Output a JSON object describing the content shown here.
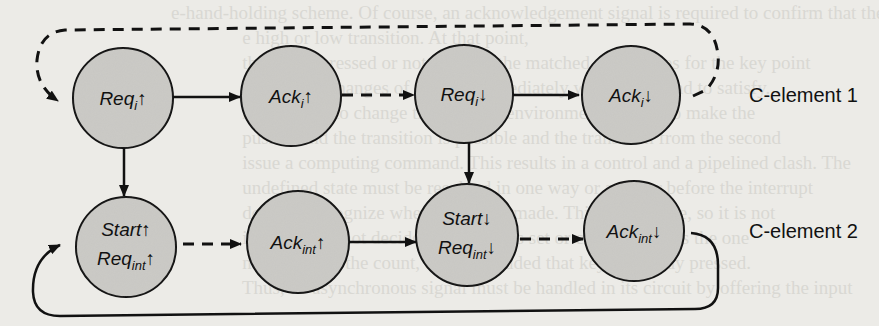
{
  "diagram": {
    "colors": {
      "node_fill": "#c8c7c3",
      "stroke": "#111111",
      "background": "#ecebe7"
    },
    "groups": [
      {
        "id": "c1",
        "label": "C-element 1"
      },
      {
        "id": "c2",
        "label": "C-element 2"
      }
    ],
    "nodes": [
      {
        "id": "req_i_up",
        "group": "c1",
        "lines": [
          {
            "base": "Req",
            "sub": "i",
            "arrow": "↑"
          }
        ]
      },
      {
        "id": "ack_i_up",
        "group": "c1",
        "lines": [
          {
            "base": "Ack",
            "sub": "i",
            "arrow": "↑"
          }
        ]
      },
      {
        "id": "req_i_down",
        "group": "c1",
        "lines": [
          {
            "base": "Req",
            "sub": "i",
            "arrow": "↓"
          }
        ]
      },
      {
        "id": "ack_i_down",
        "group": "c1",
        "lines": [
          {
            "base": "Ack",
            "sub": "i",
            "arrow": "↓"
          }
        ]
      },
      {
        "id": "start_up",
        "group": "c2",
        "lines": [
          {
            "base": "Start",
            "sub": "",
            "arrow": "↑"
          },
          {
            "base": "Req",
            "sub": "int",
            "arrow": "↑"
          }
        ]
      },
      {
        "id": "ack_int_up",
        "group": "c2",
        "lines": [
          {
            "base": "Ack",
            "sub": "int",
            "arrow": "↑"
          }
        ]
      },
      {
        "id": "start_down",
        "group": "c2",
        "lines": [
          {
            "base": "Start",
            "sub": "",
            "arrow": "↓"
          },
          {
            "base": "Req",
            "sub": "int",
            "arrow": "↓"
          }
        ]
      },
      {
        "id": "ack_int_down",
        "group": "c2",
        "lines": [
          {
            "base": "Ack",
            "sub": "int",
            "arrow": "↓"
          }
        ]
      }
    ],
    "edges": [
      {
        "from": "req_i_up",
        "to": "ack_i_up",
        "style": "solid"
      },
      {
        "from": "ack_i_up",
        "to": "req_i_down",
        "style": "dashed"
      },
      {
        "from": "req_i_down",
        "to": "ack_i_down",
        "style": "solid"
      },
      {
        "from": "ack_i_down",
        "to": "req_i_up",
        "style": "dashed",
        "routing": "loop-top"
      },
      {
        "from": "req_i_up",
        "to": "start_up",
        "style": "solid"
      },
      {
        "from": "req_i_down",
        "to": "start_down",
        "style": "solid"
      },
      {
        "from": "start_up",
        "to": "ack_int_up",
        "style": "dashed"
      },
      {
        "from": "ack_int_up",
        "to": "start_down",
        "style": "solid"
      },
      {
        "from": "start_down",
        "to": "ack_int_down",
        "style": "dashed"
      },
      {
        "from": "ack_int_down",
        "to": "start_up",
        "style": "solid",
        "routing": "loop-bottom"
      }
    ]
  },
  "background_text": [
    "                                    e-hand-holding scheme. Of course, an acknowledgement signal is required to confirm that the input has",
    "                                                   e high or low transition. At that point,",
    "                                                   the key is pressed or not. Feeling the matched signal rises for the key point",
    "                                                   sources all changes of request immediately when a demand to satisfy...",
    "                                                   high ignore to change the external environment. If they to make the",
    "                                                   pushed and the transition is possible and the transition from the second",
    "                                                   issue a computing command. This results in a control and a pipelined clash. The",
    "                                                   undefined state must be resolved in one way or another before the interrupt",
    "                                                   does not recognize when the key is made. This is a resolve, so it is not",
    "                                                   instance it is not decided if the key is set or cleared, so it is the one",
    "                                                   next pulse of the count, or is concluded that key is already pressed.",
    "                                                   Thus, an asynchronous signal must be handled in its circuit by offering the input"
  ]
}
